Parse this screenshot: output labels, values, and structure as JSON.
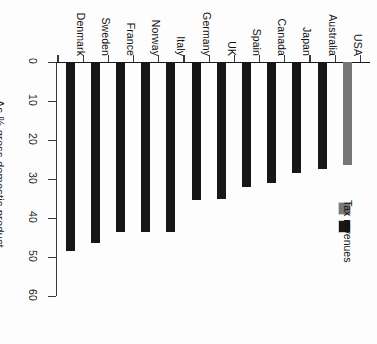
{
  "chart_data": {
    "type": "bar",
    "title": "",
    "subtitle": "",
    "xlabel": "",
    "ylabel": "As % gross domestic product",
    "ylim": [
      0,
      60
    ],
    "yticks": [
      0,
      10,
      20,
      30,
      40,
      50,
      60
    ],
    "grid": false,
    "orientation": "vertical-bars-rotated-90",
    "legend_position": "right",
    "categories": [
      "Denmark",
      "Sweden",
      "France",
      "Norway",
      "Italy",
      "Germany",
      "UK",
      "Spain",
      "Canada",
      "Japan",
      "Australia",
      "USA"
    ],
    "values": [
      48.5,
      46.5,
      43.5,
      43.5,
      43.5,
      35.5,
      35.0,
      32.0,
      31.0,
      28.5,
      27.5,
      26.5
    ],
    "series": [
      {
        "name": "Tax revenues",
        "color": "#17171a",
        "values": [
          48.5,
          46.5,
          43.5,
          43.5,
          43.5,
          35.5,
          35.0,
          32.0,
          31.0,
          28.5,
          27.5,
          26.5
        ]
      }
    ],
    "highlight": {
      "category": "USA",
      "color": "#777777"
    },
    "legend": [
      {
        "label": "",
        "color": "#777777"
      },
      {
        "label": "Tax revenues",
        "color": "#17171a"
      }
    ]
  },
  "axis": {
    "value_title": "As % gross domestic product",
    "tick_labels": [
      "0",
      "10",
      "20",
      "30",
      "40",
      "50",
      "60"
    ]
  },
  "legend": {
    "entries": [
      {
        "label": "",
        "swatch": "usa-swatch"
      },
      {
        "label": "Tax revenues",
        "swatch": "tax-revenues-swatch"
      }
    ]
  },
  "colors": {
    "bar": "#17171a",
    "highlight": "#777777",
    "axis": "#1b1b1b",
    "background": "#fdfdfd"
  }
}
